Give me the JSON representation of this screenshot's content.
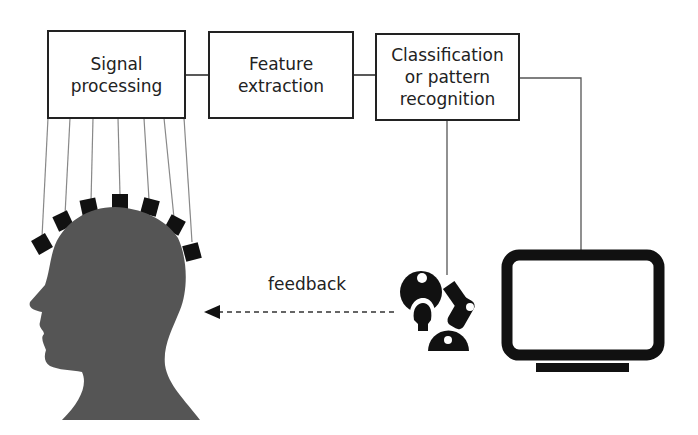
{
  "diagram": {
    "blocks": [
      {
        "id": "signal_processing",
        "label": "Signal\nprocessing"
      },
      {
        "id": "feature_extraction",
        "label": "Feature\nextraction"
      },
      {
        "id": "classification",
        "label": "Classification\nor pattern\nrecognition"
      }
    ],
    "feedback_label": "feedback",
    "icons": [
      "head-with-electrodes-icon",
      "robotic-arm-icon",
      "monitor-icon"
    ],
    "colors": {
      "stroke": "#222222",
      "head": "#555555",
      "device": "#111111",
      "wire": "#888888"
    }
  }
}
